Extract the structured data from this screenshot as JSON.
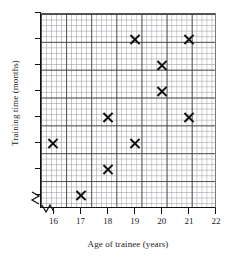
{
  "chart_data": {
    "type": "scatter",
    "title": "",
    "xlabel": "Age of trainee (years)",
    "ylabel": "Training time (months)",
    "xlim": [
      15.5,
      22
    ],
    "ylim": [
      5.5,
      13
    ],
    "xticks": [
      16,
      17,
      18,
      19,
      20,
      21,
      22
    ],
    "yticks": [
      6,
      7,
      8,
      9,
      10,
      11,
      12,
      13
    ],
    "grid": true,
    "legend": null,
    "x_axis_broken": true,
    "y_axis_broken": true,
    "marker": "x-cross",
    "points": [
      {
        "x": 16,
        "y": 8
      },
      {
        "x": 17,
        "y": 6
      },
      {
        "x": 18,
        "y": 9
      },
      {
        "x": 18,
        "y": 7
      },
      {
        "x": 19,
        "y": 12
      },
      {
        "x": 19,
        "y": 8
      },
      {
        "x": 20,
        "y": 11
      },
      {
        "x": 20,
        "y": 10
      },
      {
        "x": 21,
        "y": 12
      },
      {
        "x": 21,
        "y": 9
      }
    ]
  },
  "colors": {
    "marker": "#111111",
    "axis": "#111111",
    "major_grid": "#3c3c3c",
    "minor_grid": "#8c8c96",
    "background": "#ffffff"
  }
}
